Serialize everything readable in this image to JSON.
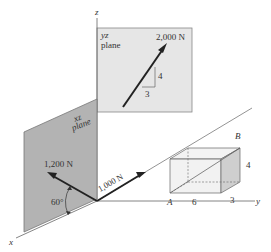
{
  "diagram": {
    "axes": {
      "x": "x",
      "y": "y",
      "z": "z"
    },
    "yz_plane": {
      "label_line1": "yz",
      "label_line2": "plane"
    },
    "xz_plane": {
      "label_line1": "xz",
      "label_line2": "plane"
    },
    "forces": {
      "f2000": "2,000 N",
      "f1200": "1,200 N",
      "f1000": "1,000 N"
    },
    "slope": {
      "rise": "4",
      "run": "3"
    },
    "angle": "60°",
    "box": {
      "point_a": "A",
      "point_b": "B",
      "dim_length": "6",
      "dim_depth": "3",
      "dim_height": "4"
    },
    "colors": {
      "plane_yz": "#e6e6e6",
      "plane_xz": "#b3b3b3",
      "box_front": "#ececec",
      "box_side": "#cfcfcf",
      "arrow": "#222222",
      "axis": "#666666"
    }
  }
}
